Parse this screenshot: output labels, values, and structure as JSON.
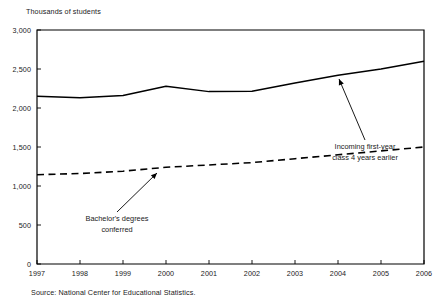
{
  "chart_data": {
    "type": "line",
    "title": "",
    "ylabel": "Thousands of students",
    "xlabel": "",
    "categories": [
      "1997",
      "1998",
      "1999",
      "2000",
      "2001",
      "2002",
      "2003",
      "2004",
      "2005",
      "2006"
    ],
    "x": [
      1997,
      1998,
      1999,
      2000,
      2001,
      2002,
      2003,
      2004,
      2005,
      2006
    ],
    "ylim": [
      0,
      3000
    ],
    "xlim": [
      1997,
      2006
    ],
    "yticks": [
      0,
      500,
      1000,
      1500,
      2000,
      2500,
      3000
    ],
    "ytick_labels": [
      "0",
      "500",
      "1,000",
      "1,500",
      "2,000",
      "2,500",
      "3,000"
    ],
    "xtick_labels": [
      "1997",
      "1998",
      "1999",
      "2000",
      "2001",
      "2002",
      "2003",
      "2004",
      "2005",
      "2006"
    ],
    "grid": false,
    "legend_position": "none",
    "series": [
      {
        "name": "Incoming first-year class 4 years earlier",
        "style": "solid",
        "color": "#000000",
        "values": [
          2150,
          2130,
          2160,
          2280,
          2210,
          2215,
          2320,
          2420,
          2500,
          2600
        ]
      },
      {
        "name": "Bachelor's degrees conferred",
        "style": "dashed",
        "color": "#000000",
        "values": [
          1145,
          1160,
          1190,
          1240,
          1270,
          1300,
          1350,
          1400,
          1450,
          1500
        ]
      }
    ],
    "annotations": [
      {
        "id": "incoming-class",
        "text_line1": "Incoming first-year",
        "text_line2": "class 4 years earlier",
        "arrow_from": [
          365,
          140
        ],
        "arrow_to": [
          339,
          79
        ]
      },
      {
        "id": "bachelors-degrees",
        "text_line1": "Bachelor's degrees",
        "text_line2": "conferred",
        "arrow_from": [
          117,
          212
        ],
        "arrow_to": [
          157,
          173
        ]
      }
    ],
    "source": "Source: National Center for Educational Statistics."
  },
  "axis": {
    "unit_label": "Thousands of students"
  },
  "source": {
    "text": "Source: National Center for Educational Statistics."
  },
  "annotations": {
    "incoming": {
      "line1": "Incoming first-year",
      "line2": "class 4 years earlier"
    },
    "bachelors": {
      "line1": "Bachelor's degrees",
      "line2": "conferred"
    }
  }
}
